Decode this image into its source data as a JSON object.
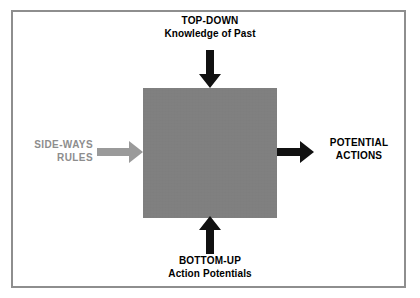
{
  "diagram": {
    "title_absent": true,
    "central_box": {
      "name": "processing-box",
      "fill_color": "#808080",
      "label": ""
    },
    "frame": {
      "border_color": "#8e8e8e"
    },
    "inputs": {
      "top": {
        "line1": "TOP-DOWN",
        "line2": "Knowledge of Past",
        "arrow_color": "#000000",
        "arrow_direction": "down"
      },
      "bottom": {
        "line1": "BOTTOM-UP",
        "line2": "Action Potentials",
        "arrow_color": "#000000",
        "arrow_direction": "up"
      },
      "left": {
        "line1": "SIDE-WAYS",
        "line2": "RULES",
        "text_color": "#8d8d8d",
        "arrow_color": "#9a9a9a",
        "arrow_direction": "right"
      }
    },
    "outputs": {
      "right": {
        "line1": "POTENTIAL",
        "line2": "ACTIONS",
        "arrow_color": "#000000",
        "arrow_direction": "right"
      }
    },
    "icons": {
      "arrow_down": "arrow-down-icon",
      "arrow_up": "arrow-up-icon",
      "arrow_right": "arrow-right-icon"
    }
  }
}
